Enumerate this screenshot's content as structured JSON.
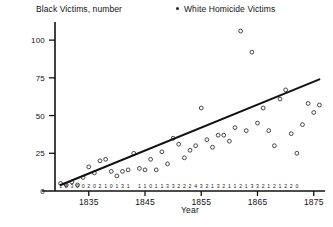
{
  "legend": {
    "left_label": "Black Victims, number",
    "right_label": "White Homicide Victims",
    "right_marker": "filled-dot"
  },
  "axes": {
    "x_title": "Year",
    "y_title": "",
    "x_ticks": [
      "1835",
      "1845",
      "1855",
      "1865",
      "1875"
    ],
    "y_ticks": [
      "0",
      "25",
      "50",
      "75",
      "100"
    ]
  },
  "chart_data": {
    "type": "scatter",
    "title": "",
    "subtitle": "",
    "xlabel": "Year",
    "ylabel": "",
    "xlim": [
      1829,
      1877
    ],
    "ylim": [
      0,
      112
    ],
    "grid": false,
    "legend_position": "top",
    "x_ticks": [
      1835,
      1845,
      1855,
      1865,
      1875
    ],
    "y_ticks": [
      0,
      25,
      50,
      75,
      100
    ],
    "series": [
      {
        "name": "White Homicide Victims",
        "marker": "open-circle",
        "x": [
          1830,
          1831,
          1832,
          1833,
          1834,
          1835,
          1836,
          1837,
          1838,
          1839,
          1840,
          1841,
          1842,
          1843,
          1844,
          1845,
          1846,
          1847,
          1848,
          1849,
          1850,
          1851,
          1852,
          1853,
          1854,
          1855,
          1856,
          1857,
          1858,
          1859,
          1860,
          1861,
          1862,
          1863,
          1864,
          1865,
          1866,
          1867,
          1868,
          1869,
          1870,
          1871,
          1872,
          1873,
          1874,
          1875,
          1876
        ],
        "y": [
          5,
          4,
          6,
          4,
          9,
          16,
          12,
          20,
          21,
          13,
          10,
          13,
          14,
          25,
          15,
          14,
          21,
          14,
          26,
          18,
          35,
          31,
          22,
          27,
          30,
          55,
          34,
          29,
          37,
          37,
          33,
          42,
          106,
          40,
          92,
          45,
          55,
          40,
          30,
          61,
          67,
          38,
          25,
          44,
          58,
          52,
          57
        ]
      },
      {
        "name": "Trend line",
        "marker": "line",
        "x": [
          1830,
          1876
        ],
        "y": [
          4,
          74
        ]
      }
    ],
    "point_labels": {
      "name": "Black Victims, number",
      "x": [
        1830,
        1831,
        1832,
        1833,
        1834,
        1835,
        1836,
        1837,
        1838,
        1839,
        1840,
        1841,
        1842,
        1843,
        1844,
        1845,
        1846,
        1847,
        1848,
        1849,
        1850,
        1851,
        1852,
        1853,
        1854,
        1855,
        1856,
        1857,
        1858,
        1859,
        1860,
        1861,
        1862,
        1863,
        1864,
        1865,
        1866,
        1867,
        1868,
        1869,
        1870,
        1871,
        1872,
        1873,
        1874,
        1875,
        1876
      ],
      "values": [
        "1",
        "8",
        "3",
        "0",
        "0",
        "2",
        "0",
        "2",
        "1",
        "0",
        "1",
        "3",
        "1",
        "",
        "1",
        "1",
        "0",
        "1",
        "1",
        "3",
        "3",
        "2",
        "2",
        "2",
        "4",
        "3",
        "2",
        "1",
        "3",
        "2",
        "1",
        "1",
        "2",
        "1",
        "3",
        "3",
        "2",
        "1",
        "2",
        "1",
        "2",
        "2",
        "0",
        "",
        "",
        "",
        ""
      ]
    }
  }
}
